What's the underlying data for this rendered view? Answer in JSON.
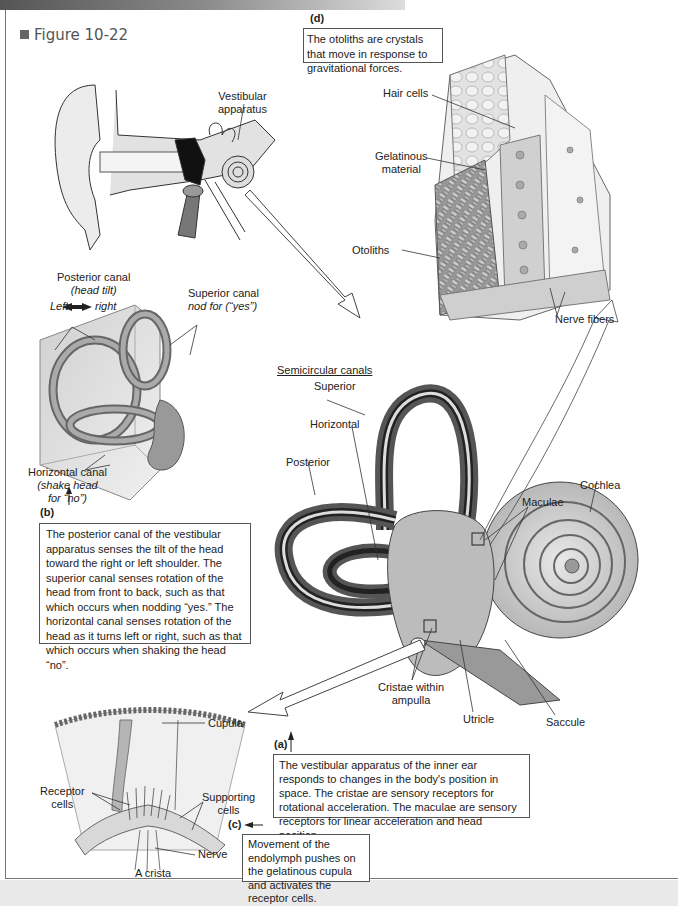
{
  "figure": {
    "title": "Figure 10-22"
  },
  "panels": {
    "a": {
      "tag": "(a)",
      "caption": "The vestibular apparatus of the inner ear responds to changes in the body's position in space.  The cristae are sensory receptors for rotational acceleration. The maculae are sensory receptors for linear acceleration and head position.",
      "labels": {
        "section_heading": "Semicircular canals",
        "superior": "Superior",
        "horizontal": "Horizontal",
        "posterior": "Posterior",
        "cochlea": "Cochlea",
        "maculae": "Maculae",
        "cristae_line1": "Cristae within",
        "cristae_line2": "ampulla",
        "utricle": "Utricle",
        "saccule": "Saccule"
      }
    },
    "b": {
      "tag": "(b)",
      "caption": "The posterior canal of the vestibular apparatus senses the tilt of the head toward the right or left shoulder.  The superior canal senses rotation of the head from front to back, such as that which occurs when nodding “yes.” The horizontal canal senses rotation of the head as it turns left or right, such as that which occurs when shaking the head “no”.",
      "labels": {
        "posterior_canal": "Posterior canal",
        "posterior_note": "(head tilt)",
        "left": "Left",
        "right": "right",
        "superior_canal": "Superior canal",
        "superior_note": "nod for (“yes”)",
        "horizontal_canal": "Horizontal canal",
        "horizontal_note1": "(shake head",
        "horizontal_note2": "for “no”)"
      }
    },
    "c": {
      "tag": "(c)",
      "caption": "Movement of the endolymph pushes on the gelatinous cupula and activates the receptor cells.",
      "labels": {
        "cupula": "Cupula",
        "receptor_line1": "Receptor",
        "receptor_line2": "cells",
        "supporting_line1": "Supporting",
        "supporting_line2": "cells",
        "nerve": "Nerve",
        "crista": "A crista"
      }
    },
    "d": {
      "tag": "(d)",
      "caption": "The otoliths are crystals that move in response to gravitational forces.",
      "labels": {
        "hair_cells": "Hair cells",
        "gelatinous_line1": "Gelatinous",
        "gelatinous_line2": "material",
        "otoliths": "Otoliths",
        "nerve_fibers": "Nerve fibers"
      }
    },
    "ear": {
      "labels": {
        "vestibular_line1": "Vestibular",
        "vestibular_line2": "apparatus"
      }
    }
  }
}
